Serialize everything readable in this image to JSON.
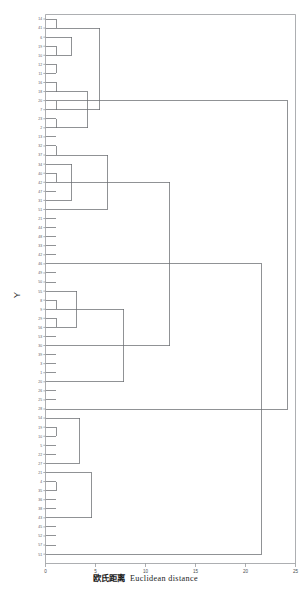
{
  "chart_data": {
    "type": "tree",
    "title": "",
    "xlabel_cjk": "欧氏距离",
    "xlabel_en": "Euclidean distance",
    "ylabel": "Y",
    "xlim": [
      0,
      25
    ],
    "xticks": [
      0,
      5,
      10,
      15,
      20,
      25
    ],
    "xticklabels": [
      "0",
      "5",
      "10",
      "15",
      "20",
      "25"
    ],
    "grid": false,
    "legend": null,
    "orientation": "horizontal-right",
    "n_leaves": 60,
    "leaf_labels": [
      "14",
      "41",
      "6",
      "19",
      "10",
      "12",
      "11",
      "16",
      "18",
      "20",
      "7",
      "23",
      "2",
      "13",
      "32",
      "37",
      "34",
      "40",
      "42",
      "47",
      "31",
      "51",
      "21",
      "44",
      "48",
      "33",
      "42",
      "46",
      "49",
      "50",
      "55",
      "8",
      "9",
      "29",
      "56",
      "53",
      "30",
      "39",
      "3",
      "1",
      "20",
      "26",
      "25",
      "28",
      "54",
      "19",
      "10",
      "5",
      "22",
      "27",
      "21",
      "4",
      "35",
      "36",
      "38",
      "43",
      "45",
      "52",
      "57",
      "51"
    ],
    "merges": [
      {
        "id": "m1",
        "x": 1.05,
        "y0": 1,
        "y1": 2,
        "note": "14-41"
      },
      {
        "id": "m2",
        "x": 1.05,
        "y0": 4,
        "y1": 5,
        "note": "19-10"
      },
      {
        "id": "m3",
        "x": 1.05,
        "y0": 6,
        "y1": 7,
        "note": "12-11"
      },
      {
        "id": "m4",
        "x": 1.05,
        "y0": 8,
        "y1": 9,
        "note": "16-18"
      },
      {
        "id": "m5",
        "x": 1.05,
        "y0": 10,
        "y1": 11,
        "note": "20-7"
      },
      {
        "id": "m6",
        "x": 1.05,
        "y0": 12,
        "y1": 13,
        "note": "23-2"
      },
      {
        "id": "m7",
        "x": 1.05,
        "y0": 15,
        "y1": 16,
        "note": "32-37"
      },
      {
        "id": "m8",
        "x": 1.05,
        "y0": 18,
        "y1": 19,
        "note": "42-47"
      },
      {
        "id": "m9",
        "x": 1.05,
        "y0": 32,
        "y1": 33,
        "note": "9-29"
      },
      {
        "id": "m10",
        "x": 1.05,
        "y0": 34,
        "y1": 35,
        "note": "56-53"
      },
      {
        "id": "m11",
        "x": 1.05,
        "y0": 46,
        "y1": 47,
        "note": "10-5"
      },
      {
        "id": "m12",
        "x": 1.05,
        "y0": 52,
        "y1": 53,
        "note": "4-35"
      },
      {
        "id": "m13",
        "x": 2.6,
        "y0": 3,
        "y1": 5,
        "note": "cluster A upper"
      },
      {
        "id": "m14",
        "x": 2.6,
        "y0": 17,
        "y1": 21,
        "note": "cluster B mid"
      },
      {
        "id": "m15",
        "x": 3.1,
        "y0": 31,
        "y1": 35,
        "note": "cluster C"
      },
      {
        "id": "m16",
        "x": 3.4,
        "y0": 45,
        "y1": 50,
        "note": "cluster D"
      },
      {
        "id": "m17",
        "x": 4.2,
        "y0": 9,
        "y1": 13,
        "note": "join lower A"
      },
      {
        "id": "m18",
        "x": 4.6,
        "y0": 51,
        "y1": 56,
        "note": "join lower D"
      },
      {
        "id": "m19",
        "x": 5.4,
        "y0": 2,
        "y1": 11,
        "note": "A merge"
      },
      {
        "id": "m20",
        "x": 6.2,
        "y0": 16,
        "y1": 22,
        "note": "B merge"
      },
      {
        "id": "m21",
        "x": 7.8,
        "y0": 33,
        "y1": 41,
        "note": "C merge"
      },
      {
        "id": "m22",
        "x": 12.4,
        "y0": 19,
        "y1": 37,
        "note": "B-C merge"
      },
      {
        "id": "m23",
        "x": 21.6,
        "y0": 28,
        "y1": 60,
        "note": "deep merge"
      },
      {
        "id": "m24",
        "x": 24.2,
        "y0": 10,
        "y1": 44,
        "note": "root"
      }
    ]
  },
  "style": {
    "line_color": "#6b6e72",
    "frame_color": "#8a8d91",
    "background": "#ffffff",
    "text_color": "#333333"
  }
}
